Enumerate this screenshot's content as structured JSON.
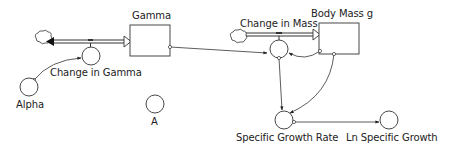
{
  "diagram": {
    "type": "stock-and-flow",
    "stocks": [
      {
        "id": "gamma",
        "label": "Gamma"
      },
      {
        "id": "body_mass",
        "label": "Body Mass g"
      }
    ],
    "flows": [
      {
        "id": "change_in_gamma",
        "label": "Change in Gamma",
        "from": "cloud",
        "to": "gamma",
        "bidirectional": true
      },
      {
        "id": "change_in_mass",
        "label": "Change in Mass",
        "from": "cloud",
        "to": "body_mass"
      }
    ],
    "converters": [
      {
        "id": "alpha",
        "label": "Alpha"
      },
      {
        "id": "a",
        "label": "A"
      },
      {
        "id": "specific_growth_rate",
        "label": "Specific Growth Rate"
      },
      {
        "id": "ln_specific_growth",
        "label": "Ln Specific Growth"
      }
    ],
    "connectors": [
      {
        "from": "alpha",
        "to": "change_in_gamma"
      },
      {
        "from": "gamma",
        "to": "change_in_mass"
      },
      {
        "from": "body_mass",
        "to": "change_in_mass"
      },
      {
        "from": "change_in_mass",
        "to": "specific_growth_rate"
      },
      {
        "from": "body_mass",
        "to": "specific_growth_rate"
      },
      {
        "from": "specific_growth_rate",
        "to": "ln_specific_growth"
      }
    ]
  },
  "labels": {
    "gamma": "Gamma",
    "body_mass": "Body Mass g",
    "change_in_gamma": "Change in Gamma",
    "change_in_mass": "Change in Mass",
    "alpha": "Alpha",
    "a": "A",
    "specific_growth_rate": "Specific Growth Rate",
    "ln_specific_growth": "Ln Specific Growth"
  }
}
